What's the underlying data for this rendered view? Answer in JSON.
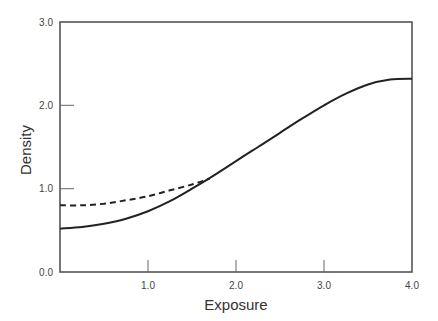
{
  "chart_data": {
    "type": "line",
    "title": "",
    "xlabel": "Exposure",
    "ylabel": "Density",
    "xlim": [
      0,
      4
    ],
    "ylim": [
      0,
      3
    ],
    "grid": false,
    "legend": null,
    "x_ticks": [
      "1.0",
      "2.0",
      "3.0",
      "4.0"
    ],
    "y_ticks": [
      "0.0",
      "1.0",
      "2.0",
      "3.0"
    ],
    "series": [
      {
        "name": "solid curve",
        "style": "solid",
        "x": [
          0.0,
          0.25,
          0.5,
          0.75,
          1.0,
          1.25,
          1.5,
          1.75,
          2.0,
          2.25,
          2.5,
          2.75,
          3.0,
          3.25,
          3.5,
          3.75,
          4.0
        ],
        "y": [
          0.52,
          0.54,
          0.58,
          0.64,
          0.73,
          0.85,
          1.0,
          1.16,
          1.33,
          1.5,
          1.67,
          1.84,
          2.0,
          2.14,
          2.25,
          2.31,
          2.32
        ]
      },
      {
        "name": "dashed curve",
        "style": "dashed",
        "x": [
          0.0,
          0.25,
          0.5,
          0.75,
          1.0,
          1.25,
          1.5,
          1.7
        ],
        "y": [
          0.8,
          0.8,
          0.82,
          0.86,
          0.91,
          0.98,
          1.05,
          1.12
        ]
      }
    ]
  },
  "labels": {
    "xlabel": "Exposure",
    "ylabel": "Density",
    "x_ticks": [
      "1.0",
      "2.0",
      "3.0",
      "4.0"
    ],
    "y_ticks": [
      "0.0",
      "1.0",
      "2.0",
      "3.0"
    ]
  }
}
